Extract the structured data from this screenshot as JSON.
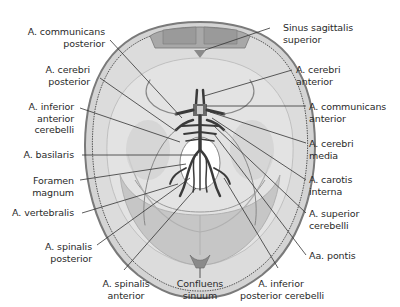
{
  "figure": {
    "colors": {
      "skull_outer": "#8c8c8c",
      "skull_fill": "#d9d9d9",
      "dura_fill": "#c8c8c8",
      "brain_floor": "#e6e6e6",
      "vessel": "#3a3a3a",
      "foramen": "#ffffff",
      "leader_line": "#333333"
    }
  },
  "labels": {
    "left": [
      {
        "id": "a-communicans-posterior",
        "lines": [
          "A. communicans",
          "posterior"
        ]
      },
      {
        "id": "a-cerebri-posterior",
        "lines": [
          "A. cerebri",
          "posterior"
        ]
      },
      {
        "id": "a-inferior-anterior-cerebelli",
        "lines": [
          "A. inferior",
          "anterior",
          "cerebelli"
        ]
      },
      {
        "id": "a-basilaris",
        "lines": [
          "A. basilaris"
        ]
      },
      {
        "id": "foramen-magnum",
        "lines": [
          "Foramen",
          "magnum"
        ]
      },
      {
        "id": "a-vertebralis",
        "lines": [
          "A. vertebralis"
        ]
      },
      {
        "id": "a-spinalis-posterior",
        "lines": [
          "A. spinalis",
          "posterior"
        ]
      }
    ],
    "right": [
      {
        "id": "sinus-sagittalis-superior",
        "lines": [
          "Sinus sagittalis",
          "superior"
        ]
      },
      {
        "id": "a-cerebri-anterior",
        "lines": [
          "A. cerebri",
          "anterior"
        ]
      },
      {
        "id": "a-communicans-anterior",
        "lines": [
          "A. communicans",
          "anterior"
        ]
      },
      {
        "id": "a-cerebri-media",
        "lines": [
          "A. cerebri",
          "media"
        ]
      },
      {
        "id": "a-carotis-interna",
        "lines": [
          "A. carotis",
          "interna"
        ]
      },
      {
        "id": "a-superior-cerebelli",
        "lines": [
          "A. superior",
          "cerebelli"
        ]
      },
      {
        "id": "aa-pontis",
        "lines": [
          "Aa. pontis"
        ]
      }
    ],
    "bottom": [
      {
        "id": "a-spinalis-anterior",
        "lines": [
          "A. spinalis",
          "anterior"
        ]
      },
      {
        "id": "confluens-sinuum",
        "lines": [
          "Confluens",
          "sinuum"
        ]
      },
      {
        "id": "a-inferior-posterior-cerebelli",
        "lines": [
          "A. inferior",
          "posterior cerebelli"
        ]
      }
    ]
  }
}
